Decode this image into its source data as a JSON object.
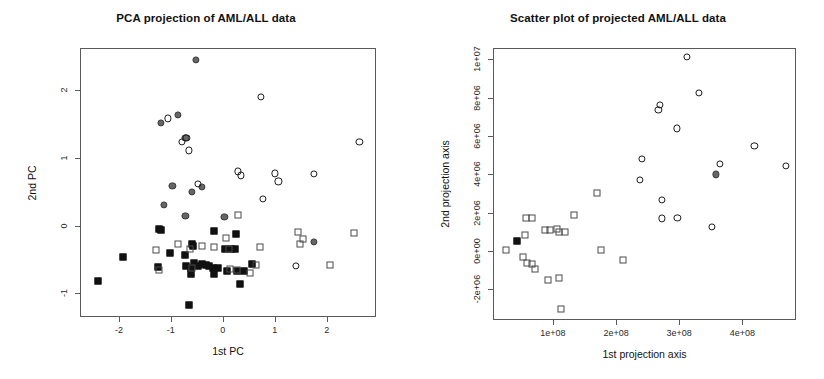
{
  "figure": {
    "width": 824,
    "height": 379,
    "background": "#ffffff",
    "marker_colors": {
      "open_circle": "#1b1b1b",
      "filled_circle": "#666666",
      "open_square": "#4a4a4a",
      "filled_square": "#111111"
    }
  },
  "chart_data": [
    {
      "type": "scatter",
      "id": "pca-projection",
      "title": "PCA projection of AML/ALL data",
      "xlabel": "1st PC",
      "ylabel": "2nd PC",
      "xlim": [
        -2.75,
        2.95
      ],
      "ylim": [
        -1.35,
        2.62
      ],
      "xticks": [
        -2,
        -1,
        0,
        1,
        2
      ],
      "xtick_labels": [
        "-2",
        "-1",
        "0",
        "1",
        "2"
      ],
      "yticks": [
        -1,
        0,
        1,
        2
      ],
      "ytick_labels": [
        "-1",
        "0",
        "1",
        "2"
      ],
      "grid": false,
      "legend": null,
      "series": [
        {
          "name": "filled-circle",
          "marker": "filled_circle",
          "points": [
            [
              -0.52,
              2.45
            ],
            [
              -1.19,
              1.52
            ],
            [
              -0.87,
              1.63
            ],
            [
              -0.72,
              1.29
            ],
            [
              -0.97,
              0.59
            ],
            [
              -0.59,
              0.5
            ],
            [
              -0.4,
              0.57
            ],
            [
              -1.13,
              0.3
            ],
            [
              -0.72,
              0.14
            ],
            [
              0.03,
              0.13
            ],
            [
              1.76,
              -0.24
            ]
          ]
        },
        {
          "name": "open-circle",
          "marker": "open_circle",
          "points": [
            [
              -1.06,
              1.58
            ],
            [
              -0.79,
              1.23
            ],
            [
              -0.7,
              1.29
            ],
            [
              -0.66,
              1.11
            ],
            [
              0.74,
              1.9
            ],
            [
              2.63,
              1.23
            ],
            [
              0.29,
              0.8
            ],
            [
              0.35,
              0.74
            ],
            [
              1.0,
              0.77
            ],
            [
              1.07,
              0.65
            ],
            [
              1.76,
              0.76
            ],
            [
              0.77,
              0.39
            ],
            [
              -0.48,
              0.62
            ],
            [
              1.41,
              -0.6
            ]
          ]
        },
        {
          "name": "filled-square",
          "marker": "filled_square",
          "points": [
            [
              -2.41,
              -0.82
            ],
            [
              -1.93,
              -0.46
            ],
            [
              -1.22,
              -0.05
            ],
            [
              -1.19,
              -0.07
            ],
            [
              -1.25,
              -0.61
            ],
            [
              -1.01,
              -0.4
            ],
            [
              -0.73,
              -0.44
            ],
            [
              -0.6,
              -0.27
            ],
            [
              -0.17,
              -0.08
            ],
            [
              0.25,
              -0.13
            ],
            [
              -0.7,
              -0.59
            ],
            [
              -0.62,
              -0.63
            ],
            [
              -0.55,
              -0.56
            ],
            [
              -0.48,
              -0.59
            ],
            [
              -0.41,
              -0.57
            ],
            [
              -0.33,
              -0.58
            ],
            [
              -0.26,
              -0.6
            ],
            [
              -0.18,
              -0.62
            ],
            [
              -0.1,
              -0.62
            ],
            [
              -0.62,
              -0.72
            ],
            [
              -0.17,
              -0.72
            ],
            [
              0.05,
              -0.35
            ],
            [
              0.16,
              -0.35
            ],
            [
              0.24,
              -0.35
            ],
            [
              0.27,
              -0.67
            ],
            [
              0.34,
              -0.86
            ],
            [
              0.41,
              -0.67
            ],
            [
              0.57,
              -0.57
            ],
            [
              -0.66,
              -1.18
            ],
            [
              0.09,
              -0.67
            ],
            [
              -0.57,
              -0.3
            ]
          ]
        },
        {
          "name": "open-square",
          "marker": "open_square",
          "points": [
            [
              -1.23,
              -0.66
            ],
            [
              -1.28,
              -0.36
            ],
            [
              -0.86,
              -0.28
            ],
            [
              -0.64,
              -0.35
            ],
            [
              -0.4,
              -0.3
            ],
            [
              -0.17,
              -0.31
            ],
            [
              0.07,
              -0.19
            ],
            [
              0.11,
              -0.34
            ],
            [
              0.13,
              -0.64
            ],
            [
              0.27,
              -0.66
            ],
            [
              0.53,
              -0.7
            ],
            [
              0.71,
              -0.31
            ],
            [
              0.64,
              -0.58
            ],
            [
              1.45,
              -0.1
            ],
            [
              1.48,
              -0.27
            ],
            [
              1.55,
              -0.2
            ],
            [
              2.52,
              -0.11
            ],
            [
              2.07,
              -0.58
            ],
            [
              0.3,
              0.15
            ],
            [
              -0.59,
              -0.62
            ]
          ]
        }
      ]
    },
    {
      "type": "scatter",
      "id": "projected-scatter",
      "title": "Scatter plot of projected AML/ALL data",
      "xlabel": "1st projection axis",
      "ylabel": "2nd projection axis",
      "xlim": [
        5000000,
        485000000
      ],
      "ylim": [
        -3600000,
        10600000
      ],
      "xticks": [
        100000000,
        200000000,
        300000000,
        400000000
      ],
      "xtick_labels": [
        "1e+08",
        "2e+08",
        "3e+08",
        "4e+08"
      ],
      "yticks": [
        -2000000,
        0,
        2000000,
        4000000,
        6000000,
        8000000,
        10000000
      ],
      "ytick_labels": [
        "-2e+06",
        "0e+00",
        "2e+06",
        "4e+06",
        "6e+06",
        "8e+06",
        "1e+07"
      ],
      "grid": false,
      "legend": null,
      "series": [
        {
          "name": "open-circle",
          "marker": "open_circle",
          "points": [
            [
              312000000,
              10150000
            ],
            [
              331000000,
              8270000
            ],
            [
              269000000,
              7650000
            ],
            [
              267000000,
              7350000
            ],
            [
              296000000,
              6400000
            ],
            [
              419000000,
              5500000
            ],
            [
              241000000,
              4800000
            ],
            [
              365000000,
              4550000
            ],
            [
              469000000,
              4450000
            ],
            [
              238000000,
              3700000
            ],
            [
              273000000,
              2650000
            ],
            [
              272000000,
              1700000
            ],
            [
              297000000,
              1750000
            ],
            [
              352000000,
              1250000
            ]
          ]
        },
        {
          "name": "filled-circle",
          "marker": "filled_circle",
          "points": [
            [
              358000000,
              4000000
            ]
          ]
        },
        {
          "name": "open-square",
          "marker": "open_square",
          "points": [
            [
              25000000,
              30000
            ],
            [
              57000000,
              1700000
            ],
            [
              67000000,
              1700000
            ],
            [
              55000000,
              820000
            ],
            [
              52000000,
              -330000
            ],
            [
              59000000,
              -640000
            ],
            [
              66000000,
              -670000
            ],
            [
              72000000,
              -930000
            ],
            [
              92000000,
              -1520000
            ],
            [
              110000000,
              -1420000
            ],
            [
              113000000,
              -3000000
            ],
            [
              88000000,
              1100000
            ],
            [
              95000000,
              1080000
            ],
            [
              107000000,
              1150000
            ],
            [
              110000000,
              1010000
            ],
            [
              119000000,
              980000
            ],
            [
              134000000,
              1870000
            ],
            [
              170000000,
              3050000
            ],
            [
              176000000,
              50000
            ],
            [
              211000000,
              -470000
            ]
          ]
        },
        {
          "name": "filled-square",
          "marker": "filled_square",
          "points": [
            [
              43000000,
              550000
            ]
          ]
        }
      ]
    }
  ]
}
